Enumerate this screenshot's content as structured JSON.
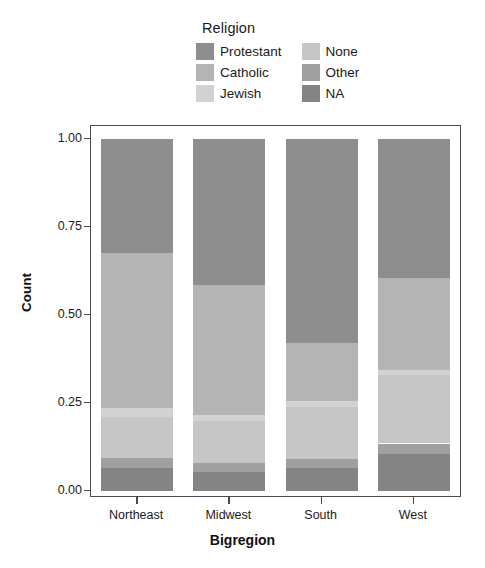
{
  "chart_data": {
    "type": "bar",
    "subtype": "stacked-proportional",
    "title": "",
    "xlabel": "Bigregion",
    "ylabel": "Count",
    "ylim": [
      0.0,
      1.0
    ],
    "ytick_labels": [
      "0.00",
      "0.25",
      "0.50",
      "0.75",
      "1.00"
    ],
    "ytick_values": [
      0.0,
      0.25,
      0.5,
      0.75,
      1.0
    ],
    "grid": false,
    "legend_title": "Religion",
    "legend_position": "top",
    "categories": [
      "Northeast",
      "Midwest",
      "South",
      "West"
    ],
    "stack_order_bottom_to_top": [
      "NA",
      "Other",
      "None",
      "Jewish",
      "Catholic",
      "Protestant"
    ],
    "series": [
      {
        "name": "Protestant",
        "color": "#8e8e8e",
        "values": [
          0.325,
          0.415,
          0.58,
          0.395
        ]
      },
      {
        "name": "Catholic",
        "color": "#b4b4b4",
        "values": [
          0.44,
          0.37,
          0.165,
          0.26
        ]
      },
      {
        "name": "Jewish",
        "color": "#d2d2d2",
        "values": [
          0.025,
          0.015,
          0.015,
          0.015
        ]
      },
      {
        "name": "None",
        "color": "#c6c6c6",
        "values": [
          0.115,
          0.12,
          0.15,
          0.195
        ]
      },
      {
        "name": "Other",
        "color": "#a0a0a0",
        "values": [
          0.03,
          0.025,
          0.025,
          0.03
        ]
      },
      {
        "name": "NA",
        "color": "#848484",
        "values": [
          0.065,
          0.055,
          0.065,
          0.105
        ]
      }
    ]
  },
  "legend": {
    "title": "Religion",
    "column_left": [
      {
        "label": "Protestant",
        "color": "#8e8e8e"
      },
      {
        "label": "Catholic",
        "color": "#b4b4b4"
      },
      {
        "label": "Jewish",
        "color": "#d2d2d2"
      }
    ],
    "column_right": [
      {
        "label": "None",
        "color": "#c6c6c6"
      },
      {
        "label": "Other",
        "color": "#a0a0a0"
      },
      {
        "label": "NA",
        "color": "#848484"
      }
    ]
  },
  "axes": {
    "y": {
      "label": "Count",
      "ticks": [
        "0.00",
        "0.25",
        "0.50",
        "0.75",
        "1.00"
      ]
    },
    "x": {
      "label": "Bigregion",
      "ticks": [
        "Northeast",
        "Midwest",
        "South",
        "West"
      ]
    }
  },
  "colors": {
    "frame": "#4a4a4a",
    "text": "#1b1b1b",
    "background": "#ffffff"
  }
}
